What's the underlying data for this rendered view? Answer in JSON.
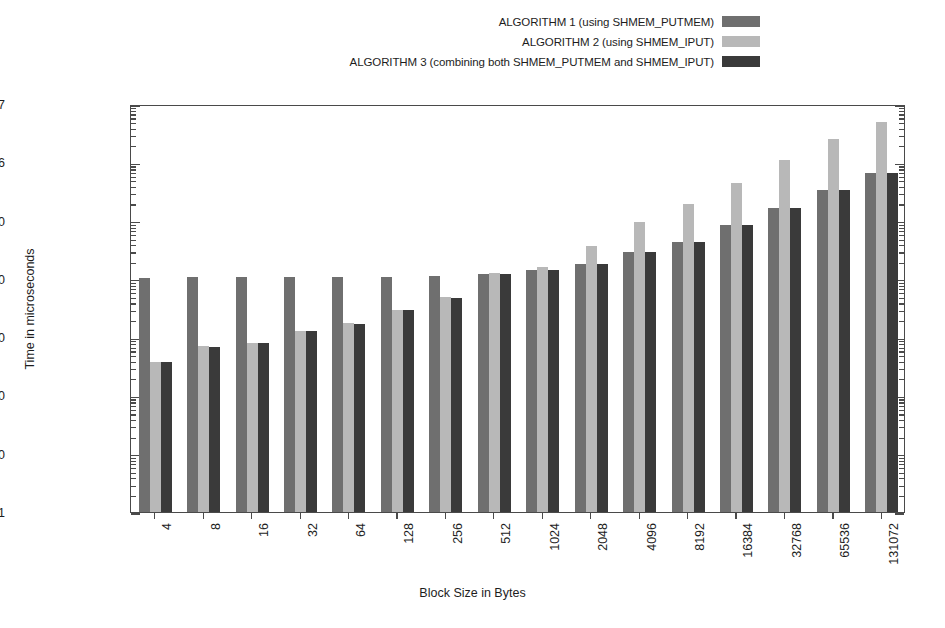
{
  "chart_data": {
    "type": "bar",
    "title": "",
    "subtitle": "",
    "xlabel": "Block Size in Bytes",
    "ylabel": "Time in microseconds",
    "yscale": "log",
    "ylim": [
      1,
      10000000
    ],
    "ytick_labels": [
      "1e+07",
      "1e+06",
      "100000",
      "10000",
      "1000",
      "100",
      "10",
      "1"
    ],
    "ytick_values": [
      10000000,
      1000000,
      100000,
      10000,
      1000,
      100,
      10,
      1
    ],
    "grid": false,
    "legend_position": "top-right",
    "categories": [
      "4",
      "8",
      "16",
      "32",
      "64",
      "128",
      "256",
      "512",
      "1024",
      "2048",
      "4096",
      "8192",
      "16384",
      "32768",
      "65536",
      "131072"
    ],
    "series": [
      {
        "name": "ALGORITHM 1 (using SHMEM_PUTMEM)",
        "color": "#6f6f6f",
        "values": [
          10500,
          10600,
          10600,
          10700,
          10600,
          10600,
          11000,
          12000,
          14000,
          18000,
          29000,
          43000,
          83000,
          165000,
          330000,
          660000
        ]
      },
      {
        "name": "ALGORITHM 2 (using SHMEM_IPUT)",
        "color": "#b8b8b8",
        "values": [
          370,
          700,
          800,
          1300,
          1750,
          2950,
          4800,
          12500,
          16000,
          37000,
          95000,
          190000,
          440000,
          1100000,
          2500000,
          5000000
        ]
      },
      {
        "name": "ALGORITHM 3 (combining both SHMEM_PUTMEM and SHMEM_IPUT)",
        "color": "#3a3a3a",
        "values": [
          370,
          690,
          790,
          1280,
          1700,
          2900,
          4700,
          12300,
          14000,
          18000,
          29000,
          43000,
          83000,
          165000,
          330000,
          660000
        ]
      }
    ]
  },
  "legend": {
    "items": [
      {
        "label": "ALGORITHM 1 (using SHMEM_PUTMEM)",
        "color": "#6f6f6f",
        "swatch_name": "legend-swatch-algorithm-1"
      },
      {
        "label": "ALGORITHM 2 (using SHMEM_IPUT)",
        "color": "#b8b8b8",
        "swatch_name": "legend-swatch-algorithm-2"
      },
      {
        "label": "ALGORITHM 3 (combining both SHMEM_PUTMEM and SHMEM_IPUT)",
        "color": "#3a3a3a",
        "swatch_name": "legend-swatch-algorithm-3"
      }
    ]
  },
  "axes": {
    "x_title": "Block Size in Bytes",
    "y_title": "Time in microseconds"
  }
}
